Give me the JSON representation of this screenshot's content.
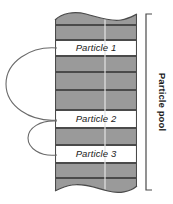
{
  "diagram": {
    "title": "Particle pool",
    "pool_label": "Particle pool",
    "colors": {
      "band_fill": "#9a9a9a",
      "slot_fill": "#ffffff",
      "outline": "#4a4a4a",
      "text": "#1a1a1a",
      "divider": "#e8e8e8",
      "background": "#ffffff"
    },
    "column": {
      "left": 55,
      "right": 137,
      "top": 12,
      "bottom": 192,
      "inner_divider_x": 105
    },
    "bands": [
      {
        "id": "band-0",
        "type": "filled",
        "top": 12,
        "bottom": 25,
        "label": ""
      },
      {
        "id": "band-1",
        "type": "filled",
        "top": 25,
        "bottom": 40,
        "label": ""
      },
      {
        "id": "slot-1",
        "type": "slot",
        "top": 40,
        "bottom": 56,
        "label": "Particle 1"
      },
      {
        "id": "band-2",
        "type": "filled",
        "top": 56,
        "bottom": 72,
        "label": ""
      },
      {
        "id": "band-3",
        "type": "filled",
        "top": 72,
        "bottom": 90,
        "label": ""
      },
      {
        "id": "band-4",
        "type": "filled",
        "top": 90,
        "bottom": 110,
        "label": ""
      },
      {
        "id": "slot-2",
        "type": "slot",
        "top": 110,
        "bottom": 128,
        "label": "Particle 2"
      },
      {
        "id": "band-5",
        "type": "filled",
        "top": 128,
        "bottom": 145,
        "label": ""
      },
      {
        "id": "slot-3",
        "type": "slot",
        "top": 145,
        "bottom": 163,
        "label": "Particle 3"
      },
      {
        "id": "band-6",
        "type": "filled",
        "top": 163,
        "bottom": 178,
        "label": ""
      },
      {
        "id": "band-7",
        "type": "filled",
        "top": 178,
        "bottom": 192,
        "label": ""
      }
    ],
    "links": [
      {
        "id": "link-1-2",
        "from": "Particle 1",
        "to": "Particle 2",
        "from_y": 48,
        "to_y": 120,
        "bulge_x": 8
      },
      {
        "id": "link-2-3",
        "from": "Particle 2",
        "to": "Particle 3",
        "from_y": 121,
        "to_y": 155,
        "bulge_x": 30
      }
    ],
    "bracket": {
      "x": 146,
      "top": 14,
      "bottom": 190,
      "tick_length": 6,
      "label": "Particle pool",
      "label_x": 160,
      "label_y": 102,
      "rotation": 90
    }
  }
}
